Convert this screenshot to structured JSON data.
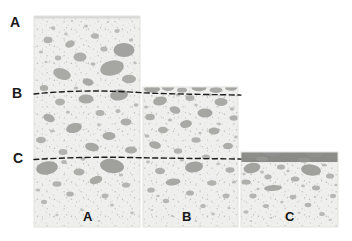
{
  "figure": {
    "type": "stratigraphic-core-photograph",
    "background_color": "#ffffff",
    "matrix_color": "#eeeeec",
    "clast_color": "#a8a8a8",
    "dark_band_color": "#8a8a8a",
    "marker_line_color": "#1a1a1a"
  },
  "horizon_labels": [
    {
      "id": "A",
      "text": "A",
      "x": 10,
      "y": 15
    },
    {
      "id": "B",
      "text": "B",
      "x": 12,
      "y": 86
    },
    {
      "id": "C",
      "text": "C",
      "x": 13,
      "y": 151
    }
  ],
  "column_labels": [
    {
      "id": "A",
      "text": "A",
      "x": 83,
      "y": 210
    },
    {
      "id": "B",
      "text": "B",
      "x": 182,
      "y": 210
    },
    {
      "id": "C",
      "text": "C",
      "x": 285,
      "y": 210
    }
  ],
  "columns": [
    {
      "id": "A",
      "left": 34,
      "right": 140,
      "top": 16,
      "bottom": 227
    },
    {
      "id": "B",
      "left": 143,
      "right": 238,
      "top": 87,
      "bottom": 227
    },
    {
      "id": "C",
      "left": 241,
      "right": 338,
      "top": 152,
      "bottom": 227
    }
  ],
  "marker_lines": [
    {
      "id": "B",
      "y": 92,
      "from_x": 34,
      "to_x": 241,
      "style": "dashed"
    },
    {
      "id": "C",
      "y": 158,
      "from_x": 34,
      "to_x": 241,
      "style": "dashed"
    }
  ],
  "clast_layers": {
    "note": "coarse angular clasts in fine matrix",
    "large_clast_count": 64,
    "medium_clast_count": 120,
    "fine_speckle_count": 420
  }
}
